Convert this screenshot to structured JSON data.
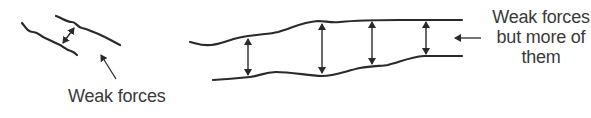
{
  "diagram": {
    "left_panel": {
      "label": "Weak forces"
    },
    "right_panel": {
      "label_lines": [
        "Weak forces",
        "but more of",
        "them"
      ]
    },
    "colors": {
      "stroke": "#2a2a2a",
      "text": "#3a3a3a",
      "background": "#ffffff"
    }
  }
}
